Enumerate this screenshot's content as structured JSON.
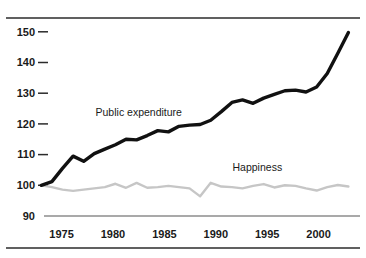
{
  "chart_data": {
    "type": "line",
    "title": "",
    "xlabel": "",
    "ylabel": "",
    "xlim": [
      1973,
      2003
    ],
    "ylim": [
      90,
      153
    ],
    "grid": false,
    "legend_position": "inline-annotation",
    "y_ticks": [
      150,
      140,
      130,
      120,
      110,
      100,
      90
    ],
    "y_tick_labels": [
      "150",
      "140",
      "130",
      "120",
      "110",
      "100",
      "90"
    ],
    "x_ticks": [
      1975,
      1980,
      1985,
      1990,
      1995,
      2000
    ],
    "x_tick_labels": [
      "1975",
      "1980",
      "1985",
      "1990",
      "1995",
      "2000"
    ],
    "x": [
      1973,
      1974,
      1975,
      1976,
      1977,
      1978,
      1979,
      1980,
      1981,
      1982,
      1983,
      1984,
      1985,
      1986,
      1987,
      1988,
      1989,
      1990,
      1991,
      1992,
      1993,
      1994,
      1995,
      1996,
      1997,
      1998,
      1999,
      2000,
      2001,
      2002
    ],
    "series": [
      {
        "name": "Public expenditure",
        "color": "#111111",
        "label_x": 1982.2,
        "label_y": 122.6,
        "values": [
          100.0,
          101.2,
          105.5,
          109.5,
          107.8,
          110.3,
          111.8,
          113.2,
          115.0,
          114.8,
          116.2,
          117.8,
          117.4,
          119.2,
          119.6,
          119.8,
          121.2,
          124.0,
          127.0,
          127.8,
          126.7,
          128.4,
          129.6,
          130.8,
          131.0,
          130.4,
          132.0,
          136.4,
          143.0,
          149.8
        ]
      },
      {
        "name": "Happiness",
        "color": "#c6c6c6",
        "label_x": 1993.4,
        "label_y": 104.6,
        "values": [
          100.0,
          99.4,
          98.6,
          98.2,
          98.6,
          99.0,
          99.4,
          100.5,
          99.2,
          100.8,
          99.2,
          99.4,
          99.8,
          99.4,
          99.0,
          96.4,
          100.8,
          99.6,
          99.4,
          99.0,
          99.8,
          100.4,
          99.3,
          100.0,
          99.8,
          99.0,
          98.3,
          99.4,
          100.1,
          99.6
        ]
      }
    ]
  }
}
